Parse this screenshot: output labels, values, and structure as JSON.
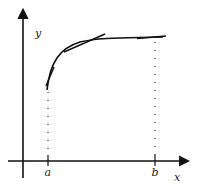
{
  "diagram": {
    "labels": {
      "y_axis": "y",
      "x_axis": "x",
      "a": "a",
      "b": "b"
    },
    "colors": {
      "stroke": "#111111",
      "background": "#ffffff"
    }
  }
}
